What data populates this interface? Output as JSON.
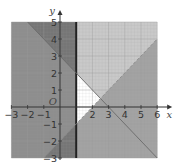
{
  "chart_data": {
    "type": "region",
    "title": "",
    "xlabel": "x",
    "ylabel": "y",
    "xlim": [
      -3,
      6
    ],
    "ylim": [
      -3,
      5
    ],
    "grid": true,
    "x_ticks": [
      -3,
      -2,
      -1,
      2,
      3,
      4,
      5,
      6
    ],
    "y_ticks": [
      -3,
      -2,
      -1,
      1,
      2,
      3,
      4,
      5
    ],
    "origin_label": "O",
    "lines": [
      {
        "name": "x = 1",
        "style": "solid-thick",
        "points": [
          [
            1,
            -3
          ],
          [
            1,
            5
          ]
        ],
        "shaded_side": "x < 1"
      },
      {
        "name": "y = -x + 3",
        "style": "solid",
        "points": [
          [
            -2,
            5
          ],
          [
            6,
            -3
          ]
        ],
        "shaded_side": "above"
      },
      {
        "name": "y = x - 2",
        "style": "dashed",
        "points": [
          [
            -1,
            -3
          ],
          [
            6,
            4
          ]
        ],
        "shaded_side": "below"
      }
    ],
    "unshaded_region": {
      "description": "Feasible region left white",
      "vertices": [
        [
          1,
          2
        ],
        [
          1,
          -1
        ],
        [
          2.5,
          0.5
        ]
      ]
    },
    "colors": {
      "background_light": "#c9c9c9",
      "left_region": "#8e8e8e",
      "above_line_region": "#c9c9c9",
      "below_dashed_region": "#a3a3a3",
      "overlap_dark": "#767676",
      "grid": "#9a9a9a",
      "axis": "#333333",
      "feasible": "#ffffff"
    }
  }
}
